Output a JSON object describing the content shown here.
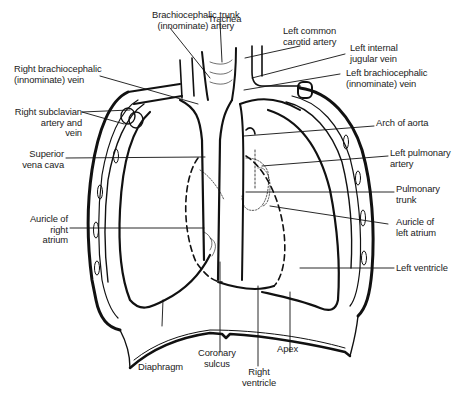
{
  "diagram": {
    "colors": {
      "ink": "#111111",
      "background": "#ffffff"
    },
    "labels": {
      "brachiocephalic_trunk": "Brachiocephalic trunk\n(innominate) artery",
      "trachea": "Trachea",
      "left_common_carotid": "Left common\ncarotid artery",
      "left_internal_jugular": "Left internal\njugular vein",
      "left_brachiocephalic_vein": "Left brachiocephalic\n(innominate) vein",
      "right_brachiocephalic_vein": "Right brachiocephalic\n(innominate) vein",
      "right_subclavian": "Right subclavian\nartery and\nvein",
      "superior_vena_cava": "Superior\nvena cava",
      "arch_of_aorta": "Arch of aorta",
      "left_pulmonary_artery": "Left pulmonary\nartery",
      "pulmonary_trunk": "Pulmonary\ntrunk",
      "auricle_right_atrium": "Auricle of\nright\natrium",
      "auricle_left_atrium": "Auricle of\nleft atrium",
      "left_ventricle": "Left ventricle",
      "diaphragm": "Diaphragm",
      "coronary_sulcus": "Coronary\nsulcus",
      "right_ventricle": "Right\nventricle",
      "apex": "Apex"
    }
  }
}
